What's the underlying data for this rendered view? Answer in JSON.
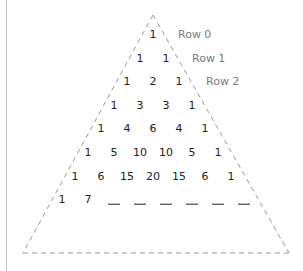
{
  "diagram": {
    "rows": [
      [
        "1"
      ],
      [
        "1",
        "1"
      ],
      [
        "1",
        "2",
        "1"
      ],
      [
        "1",
        "3",
        "3",
        "1"
      ],
      [
        "1",
        "4",
        "6",
        "4",
        "1"
      ],
      [
        "1",
        "5",
        "10",
        "10",
        "5",
        "1"
      ],
      [
        "1",
        "6",
        "15",
        "20",
        "15",
        "6",
        "1"
      ],
      [
        "1",
        "7",
        "",
        "",
        "",
        "",
        "",
        ""
      ]
    ],
    "row_labels": [
      "Row 0",
      "Row 1",
      "Row 2"
    ],
    "colors": {
      "number": "#222222",
      "label": "#7a7a7a",
      "outline": "#999999"
    }
  }
}
